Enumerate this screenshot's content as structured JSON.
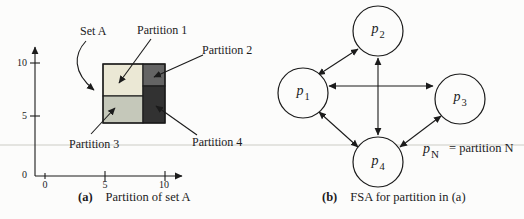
{
  "figure_a": {
    "caption_label": "(a)",
    "caption_text": "Partition of set A",
    "set_label": "Set A",
    "partitions": [
      "Partition 1",
      "Partition 2",
      "Partition 3",
      "Partition 4"
    ],
    "y_ticks": [
      "10",
      "5",
      "0"
    ],
    "x_ticks": [
      "0",
      "5",
      "10"
    ],
    "colors": {
      "partition_1": "#ebe8d5",
      "partition_2": "#646464",
      "partition_3": "#c5c8ba",
      "partition_4": "#323232"
    }
  },
  "figure_b": {
    "caption_label": "(b)",
    "caption_text": "FSA for partition in (a)",
    "nodes": [
      {
        "base": "p",
        "sub": "1"
      },
      {
        "base": "p",
        "sub": "2"
      },
      {
        "base": "p",
        "sub": "3"
      },
      {
        "base": "p",
        "sub": "4"
      }
    ],
    "edges": [
      "p1-p2",
      "p1-p3",
      "p1-p4",
      "p2-p4",
      "p3-p4"
    ],
    "legend": {
      "base": "p",
      "sub": "N",
      "equals_text": "= partition N"
    }
  }
}
